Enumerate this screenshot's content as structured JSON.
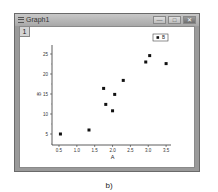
{
  "window": {
    "title": "Graph1",
    "layer_tab": "1",
    "buttons": {
      "minimize": "—",
      "maximize": "□",
      "close": "✕"
    }
  },
  "legend": {
    "marker": "■",
    "label": "B"
  },
  "caption": "b)",
  "chart_data": {
    "type": "scatter",
    "title": "",
    "xlabel": "A",
    "ylabel": "B",
    "xlim": [
      0.3,
      3.7
    ],
    "ylim": [
      2.3,
      28
    ],
    "x_ticks": [
      0.5,
      1.0,
      1.5,
      2.0,
      2.5,
      3.0,
      3.5
    ],
    "y_ticks": [
      5,
      10,
      15,
      20,
      25
    ],
    "grid": false,
    "legend_position": "top-right",
    "series": [
      {
        "name": "B",
        "marker": "square",
        "color": "#111111",
        "points": [
          {
            "x": 0.54,
            "y": 5.0
          },
          {
            "x": 1.34,
            "y": 6.0
          },
          {
            "x": 1.75,
            "y": 16.4
          },
          {
            "x": 1.81,
            "y": 12.4
          },
          {
            "x": 2.0,
            "y": 10.8
          },
          {
            "x": 2.06,
            "y": 14.9
          },
          {
            "x": 2.3,
            "y": 18.4
          },
          {
            "x": 2.93,
            "y": 23.0
          },
          {
            "x": 3.04,
            "y": 24.6
          },
          {
            "x": 3.5,
            "y": 22.6
          }
        ]
      }
    ]
  }
}
